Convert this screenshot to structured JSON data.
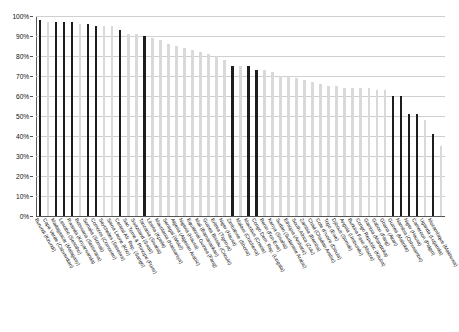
{
  "chart_data": {
    "type": "bar",
    "title": "",
    "subtitle": "",
    "xlabel": "",
    "ylabel": "",
    "ylim": [
      0,
      100
    ],
    "grid": true,
    "legend_position": "none",
    "ytick_labels": [
      "100%",
      "90%",
      "80%",
      "70%",
      "60%",
      "50%",
      "40%",
      "30%",
      "20%",
      "10%",
      "0%"
    ],
    "ytick_values": [
      100,
      90,
      80,
      70,
      60,
      50,
      40,
      30,
      20,
      10,
      0
    ],
    "colors": {
      "dark_bar": "#1d1d1d",
      "light_bar": "#d9d9d9",
      "gridline": "#cfcfcf",
      "axis": "#555555"
    },
    "series": [
      {
        "name": "Share of population",
        "categories": [
          "Burundi (Kirundi)",
          "Cape Verde (Cabverdian)",
          "Madagascar (Malagasy)",
          "Lesotho (Sesotho)",
          "Rwanda (Kinyarwanda)",
          "Botswana (Setswana)",
          "Somalia (Somali)",
          "Comoros (Comorien)",
          "Seychelles (Seselwa)",
          "Sierra Leone (Krio)",
          "Central Afr. Rep. (Sango)",
          "Sao Tome & Principe (Forro)",
          "Swaziland (Swati)",
          "Tanzania (Swahili)",
          "Liberia (Kpelle)",
          "Mauritania (Hassaniya)",
          "Senegal (Wolof)",
          "Algeria (Algerian Arabic)",
          "Nigeria (Hausa)",
          "Equatorial Guinea (Fang)",
          "Mali (Bamanankan)",
          "Guinea Bissau (Crioulo)",
          "Eritrea (Tigrinya)",
          "Niger (Hausa)",
          "Zimbabwe (Shona)",
          "Malawi (Chichewa)",
          "Mauritius (Creole)",
          "Congo Dem. Rep. (Lingala)",
          "Benin (Fon-Ewe)",
          "Kenya (Swahili)",
          "Sudan (Sudanese Arabic)",
          "Ethiopia (Amharic)",
          "South Africa (Zulu)",
          "Zambia (Bemba)",
          "Chad (Chadian Arabic)",
          "Cote d'Ivoire (Dioula)",
          "Togo (Ewe)",
          "Djibouti (Somali)",
          "Angola (Umbundu)",
          "Burkina Faso (Moore)",
          "Congo Republic (Kituba)",
          "Gambia (Mandinka)",
          "Gabon (Fang)",
          "Ghana (Akan)",
          "Guinea (Malinke)",
          "Namibia (Oshiwambo)",
          "Niger (Hausa)",
          "Cameroon (Pidgin)",
          "Uganda (Luganda)",
          "Mozambique (Makhuwa)"
        ],
        "values": [
          98,
          97,
          97,
          97,
          97,
          96,
          96,
          95,
          95,
          95,
          93,
          91,
          91,
          90,
          89,
          88,
          86,
          85,
          84,
          83,
          82,
          81,
          80,
          78,
          75,
          75,
          75,
          73,
          73,
          72,
          70,
          70,
          69,
          68,
          67,
          66,
          65,
          65,
          64,
          64,
          64,
          64,
          63,
          63,
          60,
          60,
          51,
          51,
          48,
          41
        ],
        "emphasis": [
          "dark",
          "light",
          "dark",
          "dark",
          "dark",
          "light",
          "dark",
          "dark",
          "light",
          "light",
          "dark",
          "light",
          "light",
          "dark",
          "light",
          "light",
          "light",
          "light",
          "light",
          "light",
          "light",
          "light",
          "light",
          "light",
          "dark",
          "light",
          "dark",
          "dark",
          "light",
          "light",
          "light",
          "light",
          "light",
          "light",
          "light",
          "light",
          "light",
          "light",
          "light",
          "light",
          "light",
          "light",
          "light",
          "light",
          "dark",
          "dark",
          "dark",
          "dark",
          "light",
          "dark"
        ]
      }
    ],
    "extra_trailing_bar": {
      "value": 35,
      "emphasis": "light"
    }
  }
}
